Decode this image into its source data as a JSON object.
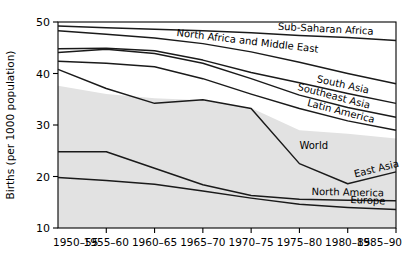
{
  "chart_data": {
    "type": "line",
    "title": "",
    "xlabel": "",
    "ylabel": "Births (per 1000 population)",
    "ylim": [
      10,
      50
    ],
    "xlim": [
      0,
      7
    ],
    "grid": false,
    "legend_position": "inline-right-labels",
    "categories": [
      "1950–55",
      "1955–60",
      "1960–65",
      "1965–70",
      "1970–75",
      "1975–80",
      "1980–85",
      "1985–90"
    ],
    "ytick_labels": [
      "10",
      "20",
      "30",
      "40",
      "50"
    ],
    "ytick_values": [
      10,
      20,
      30,
      40,
      50
    ],
    "shaded_band": {
      "name": "World",
      "fill_color": "#e2e2e2",
      "upper_values": [
        37.6,
        36.0,
        35.2,
        34.8,
        33.3,
        29.0,
        28.3,
        27.4
      ],
      "lower_values": [
        10,
        10,
        10,
        10,
        10,
        10,
        10,
        10
      ]
    },
    "series": [
      {
        "name": "Sub-Saharan Africa",
        "label": "Sub-Saharan Africa",
        "color": "#1a1a1a",
        "values": [
          49.2,
          48.9,
          48.6,
          48.3,
          47.9,
          47.4,
          47.0,
          46.4
        ]
      },
      {
        "name": "North Africa and Middle East",
        "label": "North Africa and Middle East",
        "color": "#1a1a1a",
        "values": [
          48.3,
          47.6,
          46.9,
          45.8,
          44.2,
          42.2,
          40.0,
          38.0
        ]
      },
      {
        "name": "South Asia",
        "label": "South Asia",
        "color": "#1a1a1a",
        "values": [
          44.8,
          44.9,
          44.4,
          42.6,
          40.2,
          38.2,
          36.1,
          34.2
        ]
      },
      {
        "name": "Southeast Asia",
        "label": "Southeast Asia",
        "color": "#1a1a1a",
        "values": [
          44.1,
          44.7,
          43.9,
          42.0,
          39.0,
          35.8,
          33.4,
          31.5
        ]
      },
      {
        "name": "Latin America",
        "label": "Latin America",
        "color": "#1a1a1a",
        "values": [
          42.4,
          42.0,
          41.3,
          39.0,
          36.0,
          33.2,
          30.8,
          29.0
        ]
      },
      {
        "name": "East Asia",
        "label": "East Asia",
        "color": "#1a1a1a",
        "values": [
          40.8,
          37.1,
          34.2,
          34.9,
          33.2,
          22.5,
          18.6,
          20.9
        ]
      },
      {
        "name": "North America",
        "label": "North  America",
        "color": "#1a1a1a",
        "values": [
          24.8,
          24.8,
          21.6,
          18.4,
          16.3,
          15.6,
          15.4,
          15.3
        ]
      },
      {
        "name": "Europe",
        "label": "Europe",
        "color": "#1a1a1a",
        "values": [
          19.8,
          19.2,
          18.5,
          17.2,
          15.8,
          14.6,
          14.0,
          13.6
        ]
      }
    ]
  },
  "annotations": {
    "world_band_label": "World"
  }
}
